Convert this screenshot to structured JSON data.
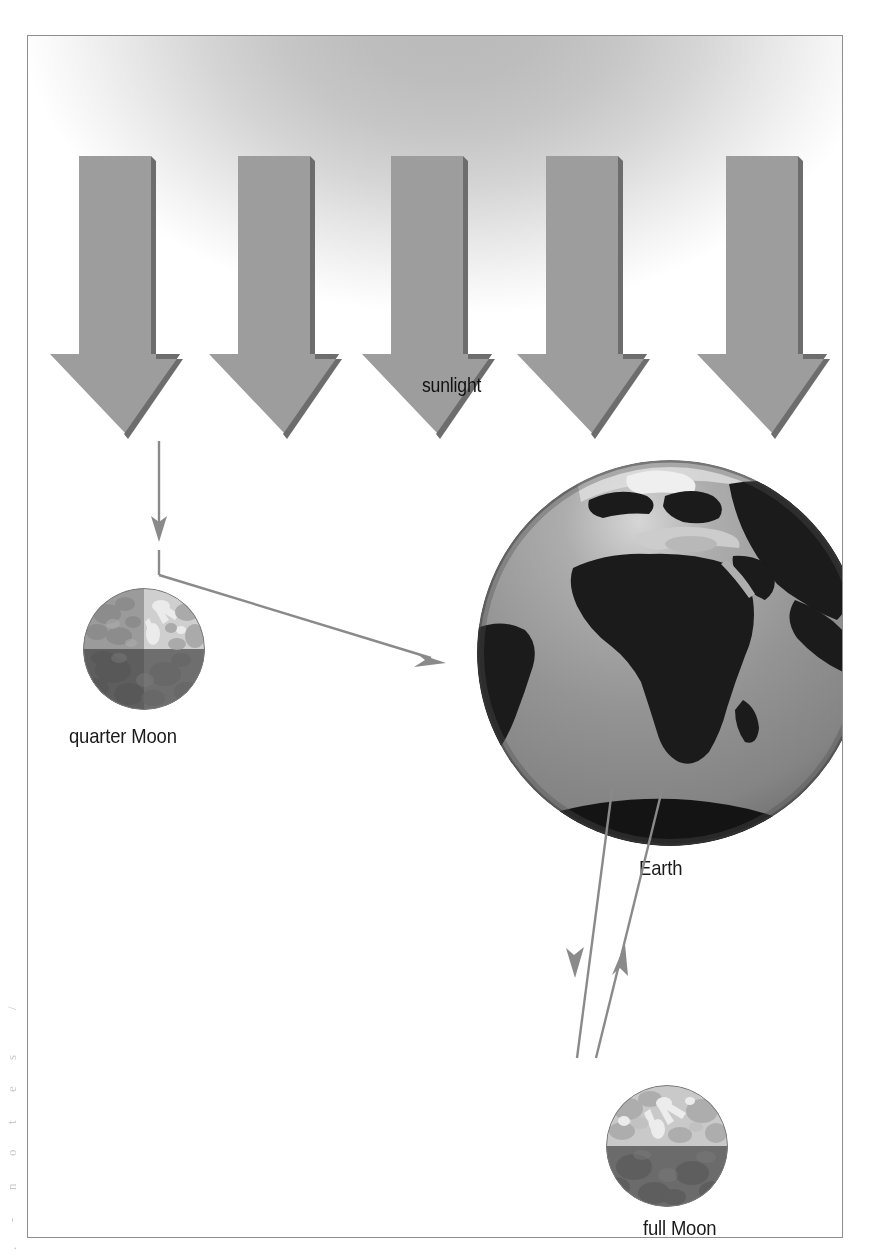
{
  "figure": {
    "kind": "astronomy-diagram",
    "caption_labels": [
      "sunlight",
      "quarter Moon",
      "Earth",
      "full Moon"
    ],
    "frame": {
      "border_color": "#8d8d8d",
      "background": "#ffffff"
    }
  },
  "labels": {
    "sunlight": "sunlight",
    "quarter_moon": "quarter Moon",
    "earth": "Earth",
    "full_moon": "full Moon"
  },
  "edge_marks": {
    "fragments": [
      "/",
      "s",
      "e",
      "t",
      "o",
      "n",
      "-",
      "."
    ]
  },
  "sunlight": {
    "label": "sunlight",
    "ray_count": 5,
    "direction": "down",
    "fill": "#9d9d9d",
    "shadow": "#6a6a6a",
    "glow_center": "#b9b9b9",
    "rays": [
      {
        "shaft_left": 51,
        "shaft_right": 123,
        "head_left": 22,
        "head_right": 152,
        "top": 0,
        "shaft_bottom": 198,
        "tip": 278
      },
      {
        "shaft_left": 210,
        "shaft_right": 282,
        "head_left": 181,
        "head_right": 311,
        "top": 0,
        "shaft_bottom": 198,
        "tip": 278
      },
      {
        "shaft_left": 363,
        "shaft_right": 435,
        "head_left": 334,
        "head_right": 464,
        "top": 0,
        "shaft_bottom": 198,
        "tip": 278
      },
      {
        "shaft_left": 518,
        "shaft_right": 590,
        "head_left": 489,
        "head_right": 619,
        "top": 0,
        "shaft_bottom": 198,
        "tip": 278
      },
      {
        "shaft_left": 698,
        "shaft_right": 770,
        "head_left": 669,
        "head_right": 799,
        "top": 0,
        "shaft_bottom": 198,
        "tip": 278
      }
    ]
  },
  "quarter_moon": {
    "label": "quarter Moon",
    "diameter": 122,
    "quadrants": {
      "upper_right": {
        "name": "sunlit-near-side",
        "tone": "#cfcfcf"
      },
      "upper_left": {
        "name": "sunlit-far-side",
        "tone": "#9b9b9b"
      },
      "lower_right": {
        "name": "dark-near-side",
        "tone": "#6e6e6e"
      },
      "lower_left": {
        "name": "dark-far-side",
        "tone": "#5e5e5e"
      }
    }
  },
  "full_moon": {
    "label": "full Moon",
    "diameter": 122,
    "halves": {
      "upper": {
        "name": "sunlit-near-side",
        "tone": "#c9c9c9"
      },
      "lower": {
        "name": "dark-far-side",
        "tone": "#6b6b6b"
      }
    }
  },
  "earth": {
    "label": "Earth",
    "diameter": 386,
    "ocean_tone": "#8f8f8f",
    "land_tone": "#1b1b1b",
    "highlight_tone": "#d8d8d8",
    "visible_features": [
      "Europe",
      "Africa",
      "Arabian Peninsula",
      "Madagascar",
      "South America"
    ]
  },
  "connectors": {
    "stroke": "#8a8a8a",
    "items": [
      {
        "name": "sunray-to-quarter-moon",
        "type": "arrow",
        "direction": "down",
        "from": [
          131,
          405
        ],
        "to": [
          131,
          500
        ]
      },
      {
        "name": "quarter-moon-stem",
        "type": "line",
        "from": [
          131,
          513
        ],
        "to": [
          131,
          538
        ]
      },
      {
        "name": "quarter-moon-to-earth",
        "type": "arrow",
        "direction": "right-down",
        "from": [
          131,
          538
        ],
        "to": [
          413,
          625
        ]
      },
      {
        "name": "earth-to-full-moon-outgoing",
        "type": "arrow",
        "direction": "down",
        "from": [
          585,
          782
        ],
        "to": [
          660,
          1040
        ]
      },
      {
        "name": "full-moon-to-earth-incoming",
        "type": "arrow",
        "direction": "up",
        "from": [
          660,
          1040
        ],
        "to": [
          706,
          782
        ]
      }
    ]
  }
}
